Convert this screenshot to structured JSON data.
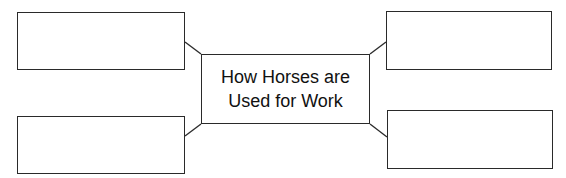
{
  "diagram": {
    "type": "graphic-organizer",
    "center": {
      "line1": "How Horses are",
      "line2": "Used for Work"
    },
    "branches": [
      {
        "position": "top-left",
        "text": ""
      },
      {
        "position": "bottom-left",
        "text": ""
      },
      {
        "position": "top-right",
        "text": ""
      },
      {
        "position": "bottom-right",
        "text": ""
      }
    ],
    "colors": {
      "stroke": "#2a2a2a",
      "fill": "#ffffff",
      "text": "#111111"
    }
  }
}
